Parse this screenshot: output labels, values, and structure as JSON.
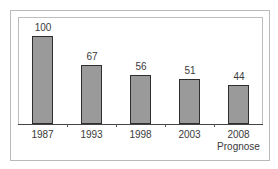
{
  "chart_data": {
    "type": "bar",
    "title": "",
    "xlabel": "",
    "ylabel": "",
    "categories": [
      "1987",
      "1993",
      "1998",
      "2003",
      "2008 Prognose"
    ],
    "category_lines": [
      [
        "1987"
      ],
      [
        "1993"
      ],
      [
        "1998"
      ],
      [
        "2003"
      ],
      [
        "2008",
        "Prognose"
      ]
    ],
    "values": [
      100,
      67,
      56,
      51,
      44
    ],
    "data_labels": [
      "100",
      "67",
      "56",
      "51",
      "44"
    ],
    "ylim": [
      0,
      100
    ],
    "grid": false,
    "legend": null,
    "bar_color": "#9a9a9a",
    "bar_edge_color": "#2e2e2e"
  }
}
